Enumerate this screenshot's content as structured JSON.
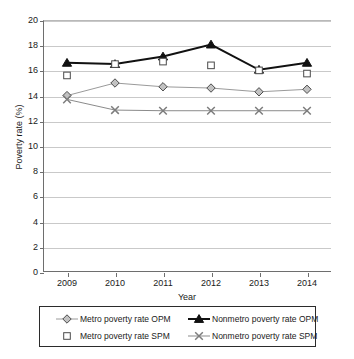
{
  "chart_data": {
    "type": "line",
    "title": "",
    "xlabel": "Year",
    "ylabel": "Poverty rate (%)",
    "categories": [
      "2009",
      "2010",
      "2011",
      "2012",
      "2013",
      "2014"
    ],
    "x": [
      2009,
      2010,
      2011,
      2012,
      2013,
      2014
    ],
    "ylim": [
      0,
      20
    ],
    "yticks": [
      0,
      2,
      4,
      6,
      8,
      10,
      12,
      14,
      16,
      18,
      20
    ],
    "grid": "horizontal",
    "legend_position": "bottom",
    "series": [
      {
        "name": "Metro poverty rate OPM",
        "marker": "diamond-gray",
        "color": "#9a9a9a",
        "values": [
          14.0,
          15.0,
          14.7,
          14.6,
          14.3,
          14.5
        ]
      },
      {
        "name": "Metro poverty rate SPM",
        "marker": "square-open",
        "color": "#5a5a5a",
        "line": "none",
        "values": [
          15.6,
          16.5,
          16.7,
          16.4,
          16.0,
          15.75
        ]
      },
      {
        "name": "Nonmetro poverty rate OPM",
        "marker": "triangle-black",
        "color": "#111111",
        "values": [
          16.6,
          16.5,
          17.1,
          18.05,
          16.05,
          16.6
        ]
      },
      {
        "name": "Nonmetro poverty rate SPM",
        "marker": "x-gray",
        "color": "#8b8b8b",
        "values": [
          13.7,
          12.85,
          12.8,
          12.8,
          12.8,
          12.8
        ]
      }
    ]
  },
  "axes": {
    "ytick_labels": [
      "20",
      "18",
      "16",
      "14",
      "12",
      "10",
      "8",
      "6",
      "4",
      "2",
      "0"
    ],
    "xtick_labels": [
      "2009",
      "2010",
      "2011",
      "2012",
      "2013",
      "2014"
    ],
    "xaxis_title": "Year",
    "yaxis_title": "Poverty rate (%)"
  },
  "legend": {
    "entries": [
      {
        "label": "Metro poverty rate OPM",
        "key": "diamond-gray-key"
      },
      {
        "label": "Nonmetro poverty rate OPM",
        "key": "triangle-black-key"
      },
      {
        "label": "Metro poverty rate SPM",
        "key": "square-open-key"
      },
      {
        "label": "Nonmetro poverty rate SPM",
        "key": "x-gray-key"
      }
    ]
  }
}
